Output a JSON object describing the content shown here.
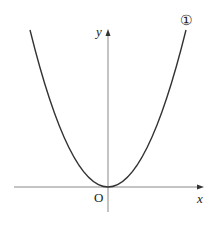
{
  "diagram": {
    "type": "parabola-graph",
    "curve_label": "①",
    "axis_labels": {
      "x": "x",
      "y": "y",
      "origin": "O"
    },
    "colors": {
      "curve": "#333333",
      "axis": "#888888",
      "text": "#222222"
    }
  }
}
